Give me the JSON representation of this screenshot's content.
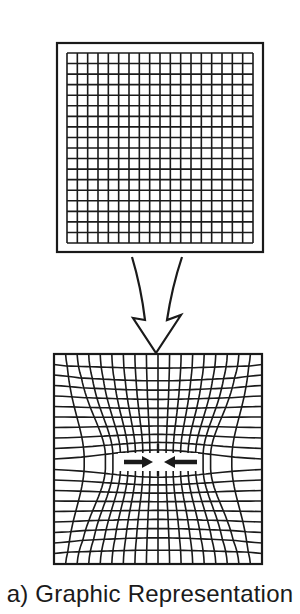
{
  "figure": {
    "caption": "a) Graphic Representation",
    "ink_color": "#1a1a1a",
    "background": "#ffffff",
    "undistorted_grid": {
      "frame": {
        "x": 57,
        "y": 43,
        "w": 206,
        "h": 209
      },
      "grid": {
        "x": 67,
        "y": 53,
        "w": 186,
        "h": 190
      },
      "columns": 18,
      "rows": 18
    },
    "transform_arrow": {
      "direction": "down",
      "tip": [
        156,
        353
      ],
      "left_tail": [
        132,
        257
      ],
      "right_tail": [
        182,
        257
      ]
    },
    "distorted_grid": {
      "box": {
        "x": 54,
        "y": 354,
        "w": 208,
        "h": 210
      },
      "columns": 18,
      "rows": 20,
      "center": [
        158,
        462
      ],
      "compression_arrows": [
        {
          "from": [
            124,
            462
          ],
          "to": [
            153,
            462
          ]
        },
        {
          "from": [
            197,
            462
          ],
          "to": [
            164,
            462
          ]
        }
      ]
    }
  }
}
